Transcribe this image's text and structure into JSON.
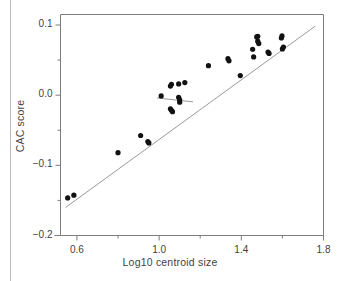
{
  "figure": {
    "background": "#ffffff",
    "frame_color": "#7d7d7d",
    "point_color": "#111111",
    "line_color": "#9a9a9a",
    "rule_color": "#b9b9b9"
  },
  "chart_data": {
    "type": "scatter",
    "title": "",
    "xlabel": "Log10 centroid size",
    "ylabel": "CAC score",
    "xlim": [
      0.52,
      1.8
    ],
    "ylim": [
      -0.2,
      0.115
    ],
    "grid": false,
    "legend": null,
    "xticks": [
      0.6,
      1.0,
      1.4,
      1.8
    ],
    "xtick_labels": [
      "0.6",
      "1.0",
      "1.4",
      "1.8"
    ],
    "xminor_ticks": [
      0.8,
      1.2,
      1.6
    ],
    "yticks": [
      0.1,
      0.0,
      -0.1,
      -0.2
    ],
    "ytick_labels": [
      "0.1",
      "0.0",
      "-0.1",
      "-0.2"
    ],
    "yminor_ticks": [
      0.05,
      -0.05,
      -0.15
    ],
    "points": [
      {
        "x": 0.555,
        "y": -0.1465
      },
      {
        "x": 0.585,
        "y": -0.1425
      },
      {
        "x": 0.8,
        "y": -0.082
      },
      {
        "x": 0.91,
        "y": -0.0575
      },
      {
        "x": 0.945,
        "y": -0.066
      },
      {
        "x": 0.95,
        "y": -0.068
      },
      {
        "x": 1.01,
        "y": -0.001
      },
      {
        "x": 1.055,
        "y": 0.013
      },
      {
        "x": 1.06,
        "y": 0.0155
      },
      {
        "x": 1.055,
        "y": -0.0195
      },
      {
        "x": 1.06,
        "y": -0.0215
      },
      {
        "x": 1.065,
        "y": -0.0235
      },
      {
        "x": 1.095,
        "y": 0.016
      },
      {
        "x": 1.095,
        "y": -0.003
      },
      {
        "x": 1.1,
        "y": -0.0065
      },
      {
        "x": 1.1,
        "y": -0.01
      },
      {
        "x": 1.125,
        "y": 0.018
      },
      {
        "x": 1.24,
        "y": 0.042
      },
      {
        "x": 1.335,
        "y": 0.052
      },
      {
        "x": 1.34,
        "y": 0.049
      },
      {
        "x": 1.395,
        "y": 0.028
      },
      {
        "x": 1.455,
        "y": 0.0655
      },
      {
        "x": 1.46,
        "y": 0.0545
      },
      {
        "x": 1.48,
        "y": 0.084
      },
      {
        "x": 1.48,
        "y": 0.077
      },
      {
        "x": 1.485,
        "y": 0.0735
      },
      {
        "x": 1.475,
        "y": 0.083
      },
      {
        "x": 1.53,
        "y": 0.0615
      },
      {
        "x": 1.535,
        "y": 0.0595
      },
      {
        "x": 1.595,
        "y": 0.0815
      },
      {
        "x": 1.598,
        "y": 0.0845
      },
      {
        "x": 1.6,
        "y": 0.066
      },
      {
        "x": 1.605,
        "y": 0.0685
      }
    ],
    "fit_lines": [
      {
        "name": "main-regression-line",
        "x1": 0.545,
        "y1": -0.16,
        "x2": 1.76,
        "y2": 0.0985
      },
      {
        "name": "secondary-short-line",
        "x1": 0.99,
        "y1": -0.004,
        "x2": 1.165,
        "y2": -0.0095
      }
    ]
  }
}
